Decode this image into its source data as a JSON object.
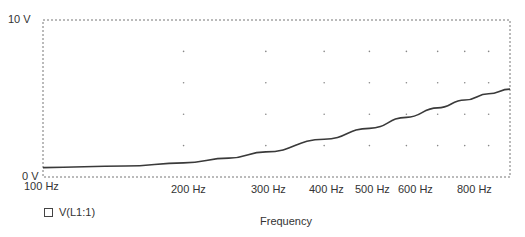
{
  "chart_data": {
    "type": "line",
    "title": "",
    "xlabel": "Frequency",
    "ylabel": "",
    "xscale": "log",
    "xlim": [
      100,
      1000
    ],
    "ylim": [
      0,
      10
    ],
    "y_ticks": [
      "0 V",
      "10 V"
    ],
    "x_ticks": [
      "100 Hz",
      "200 Hz",
      "300 Hz",
      "400 Hz",
      "500 Hz",
      "600 Hz",
      "800 Hz"
    ],
    "grid": "dotted",
    "legend": [
      "V(L1:1)"
    ],
    "series": [
      {
        "name": "V(L1:1)",
        "color": "#3a3a3a",
        "x": [
          100,
          150,
          200,
          250,
          300,
          400,
          500,
          600,
          700,
          800,
          900,
          1000
        ],
        "values": [
          0.6,
          0.7,
          0.9,
          1.2,
          1.6,
          2.4,
          3.1,
          3.8,
          4.4,
          4.9,
          5.3,
          5.6
        ]
      }
    ]
  },
  "labels": {
    "y_top": "10 V",
    "y_bottom": "0 V",
    "x_100": "100 Hz",
    "x_200": "200 Hz",
    "x_300": "300 Hz",
    "x_400": "400 Hz",
    "x_500": "500 Hz",
    "x_600": "600 Hz",
    "x_800": "800 Hz",
    "xlabel": "Frequency",
    "legend": "V(L1:1)"
  }
}
